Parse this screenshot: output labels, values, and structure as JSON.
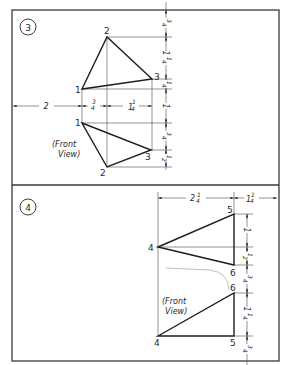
{
  "problems": [
    {
      "number": "3",
      "view_label_line1": "(Front",
      "view_label_line2": "View)",
      "top_view_points": {
        "p1": "1",
        "p2": "2",
        "p3": "3"
      },
      "front_view_points": {
        "p1": "1",
        "p2": "2",
        "p3": "3"
      },
      "horizontal_dims": [
        {
          "whole": "2",
          "frac_num": "",
          "frac_den": ""
        },
        {
          "whole": "",
          "frac_num": "3",
          "frac_den": "4"
        },
        {
          "whole": "1",
          "frac_num": "1",
          "frac_den": "4"
        }
      ],
      "vertical_dims": [
        {
          "whole": "",
          "frac_num": "3",
          "frac_den": "4"
        },
        {
          "whole": "1",
          "frac_num": "1",
          "frac_den": "4"
        },
        {
          "whole": "",
          "frac_num": "1",
          "frac_den": "4"
        },
        {
          "whole": "1",
          "frac_num": "",
          "frac_den": ""
        },
        {
          "whole": "",
          "frac_num": "3",
          "frac_den": "4"
        },
        {
          "whole": "",
          "frac_num": "1",
          "frac_den": "2"
        }
      ]
    },
    {
      "number": "4",
      "view_label_line1": "(Front",
      "view_label_line2": "View)",
      "top_view_points": {
        "p4": "4",
        "p5": "5",
        "p6": "6"
      },
      "front_view_points": {
        "p4": "4",
        "p5": "5",
        "p6": "6"
      },
      "horizontal_dims": [
        {
          "whole": "2",
          "frac_num": "1",
          "frac_den": "4"
        },
        {
          "whole": "1",
          "frac_num": "1",
          "frac_den": "4"
        }
      ],
      "vertical_dims": [
        {
          "whole": "1",
          "frac_num": "",
          "frac_den": ""
        },
        {
          "whole": "",
          "frac_num": "1",
          "frac_den": "2"
        },
        {
          "whole": "",
          "frac_num": "3",
          "frac_den": "4"
        },
        {
          "whole": "1",
          "frac_num": "1",
          "frac_den": "4"
        },
        {
          "whole": "",
          "frac_num": "3",
          "frac_den": "4"
        }
      ]
    }
  ]
}
